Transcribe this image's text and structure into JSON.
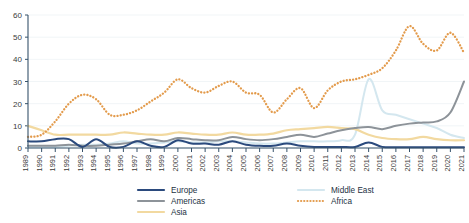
{
  "chart_data": {
    "type": "line",
    "title": "",
    "subtitle": "",
    "xlabel": "",
    "ylabel": "",
    "ylim": [
      0,
      60
    ],
    "yticks": [
      0,
      10,
      20,
      30,
      40,
      50,
      60
    ],
    "grid": true,
    "legend_position": "bottom",
    "x": [
      1989,
      1990,
      1991,
      1992,
      1993,
      1994,
      1995,
      1996,
      1997,
      1998,
      1999,
      2000,
      2001,
      2002,
      2003,
      2004,
      2005,
      2006,
      2007,
      2008,
      2009,
      2010,
      2011,
      2012,
      2013,
      2014,
      2015,
      2016,
      2017,
      2018,
      2019,
      2020,
      2021
    ],
    "categories": [
      "1989",
      "1990",
      "1991",
      "1992",
      "1993",
      "1994",
      "1995",
      "1996",
      "1997",
      "1998",
      "1999",
      "2000",
      "2001",
      "2002",
      "2003",
      "2004",
      "2005",
      "2006",
      "2007",
      "2008",
      "2009",
      "2010",
      "2011",
      "2012",
      "2013",
      "2014",
      "2015",
      "2016",
      "2017",
      "2018",
      "2019",
      "2020",
      "2021"
    ],
    "series": [
      {
        "name": "Europe",
        "color": "#2b4a7d",
        "style": "solid",
        "width": 2.0,
        "values": [
          3,
          3,
          4,
          4,
          0.5,
          4,
          0.5,
          0.5,
          3,
          1,
          0.5,
          3.5,
          2,
          2,
          1.5,
          3,
          1.5,
          1,
          1,
          2,
          1,
          0.5,
          0.5,
          0.5,
          0.5,
          2.5,
          0.5,
          0.3,
          0.3,
          0.3,
          0.3,
          0.3,
          0.3
        ]
      },
      {
        "name": "Americas",
        "color": "#8d9399",
        "style": "solid",
        "width": 2.0,
        "values": [
          1,
          1,
          1,
          1.5,
          1,
          1,
          1.5,
          2,
          3,
          4,
          3,
          4.5,
          4,
          3.5,
          3.5,
          5,
          4,
          3.5,
          4,
          5,
          6,
          5,
          6.5,
          8,
          9,
          9.5,
          8.5,
          10,
          11,
          11.5,
          12,
          16,
          30
        ]
      },
      {
        "name": "Asia",
        "color": "#f2d9a0",
        "style": "solid",
        "width": 2.2,
        "values": [
          10,
          8,
          6,
          6,
          6,
          6,
          6,
          7,
          6.5,
          6,
          6,
          7,
          6.5,
          6,
          6,
          7,
          6,
          6,
          6.5,
          8,
          8.5,
          9,
          9.5,
          9,
          8.5,
          6,
          4.5,
          4,
          4,
          5,
          4,
          3.5,
          3.5
        ]
      },
      {
        "name": "Middle East",
        "color": "#d4e7ef",
        "style": "solid",
        "width": 2.0,
        "values": [
          0.5,
          0.5,
          0.5,
          1,
          1.5,
          1.5,
          2,
          3,
          2,
          2,
          2.5,
          3,
          2.5,
          2.5,
          3,
          3,
          2.5,
          2,
          2,
          2.5,
          3,
          3,
          3,
          3.5,
          6,
          31,
          17,
          15,
          13,
          11,
          9,
          6,
          4.5
        ]
      },
      {
        "name": "Africa",
        "color": "#e39b4c",
        "style": "dotted",
        "width": 2.1,
        "values": [
          5,
          6,
          12,
          20,
          24,
          22,
          15,
          15,
          17,
          21,
          25,
          31,
          27,
          25,
          28,
          30,
          25,
          24,
          16,
          22,
          27,
          18,
          26,
          30,
          31,
          33,
          36,
          44,
          55,
          47,
          44,
          52,
          43
        ]
      }
    ]
  },
  "axis": {
    "y_tick_labels": [
      "0",
      "10",
      "20",
      "30",
      "40",
      "50",
      "60"
    ],
    "x_tick_labels": [
      "1989",
      "1990",
      "1991",
      "1992",
      "1993",
      "1994",
      "1995",
      "1996",
      "1997",
      "1998",
      "1999",
      "2000",
      "2001",
      "2002",
      "2003",
      "2004",
      "2005",
      "2006",
      "2007",
      "2008",
      "2009",
      "2010",
      "2011",
      "2012",
      "2013",
      "2014",
      "2015",
      "2016",
      "2017",
      "2018",
      "2019",
      "2020",
      "2021"
    ]
  },
  "legend": {
    "column1": [
      {
        "label": "Europe",
        "color": "#2b4a7d",
        "style": "solid"
      },
      {
        "label": "Americas",
        "color": "#8d9399",
        "style": "solid"
      },
      {
        "label": "Asia",
        "color": "#f2d9a0",
        "style": "solid"
      }
    ],
    "column2": [
      {
        "label": "Middle East",
        "color": "#d4e7ef",
        "style": "solid"
      },
      {
        "label": "Africa",
        "color": "#e39b4c",
        "style": "dotted"
      }
    ]
  },
  "colors": {
    "axis": "#36526b",
    "grid": "#eef2f5",
    "text": "#3a3a3a",
    "background": "#ffffff"
  }
}
